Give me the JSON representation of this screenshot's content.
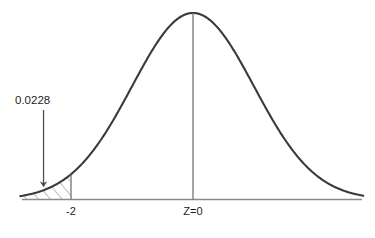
{
  "chart_data": {
    "type": "line",
    "title": "",
    "subtitle": "",
    "xlabel": "",
    "ylabel": "",
    "distribution": "standard normal",
    "mean": 0,
    "sd": 1,
    "xlim": [
      -4.1,
      4.1
    ],
    "ylim": [
      0,
      0.4
    ],
    "grid": false,
    "legend": null,
    "curve": {
      "name": "standard normal density",
      "color": "#3a3a3a",
      "x": [
        -4.1,
        -3.9,
        -3.7,
        -3.5,
        -3.3,
        -3.1,
        -2.9,
        -2.7,
        -2.5,
        -2.3,
        -2.1,
        -2.0,
        -1.9,
        -1.7,
        -1.5,
        -1.3,
        -1.1,
        -0.9,
        -0.7,
        -0.5,
        -0.3,
        -0.1,
        0.0,
        0.1,
        0.3,
        0.5,
        0.7,
        0.9,
        1.1,
        1.3,
        1.5,
        1.7,
        1.9,
        2.0,
        2.1,
        2.3,
        2.5,
        2.7,
        2.9,
        3.1,
        3.3,
        3.5,
        3.7,
        3.9,
        4.1
      ],
      "y": [
        0.0001,
        0.0002,
        0.0004,
        0.0009,
        0.0017,
        0.0033,
        0.006,
        0.0104,
        0.0175,
        0.0283,
        0.044,
        0.054,
        0.0656,
        0.094,
        0.1295,
        0.1714,
        0.2179,
        0.2661,
        0.3123,
        0.3521,
        0.3814,
        0.397,
        0.3989,
        0.397,
        0.3814,
        0.3521,
        0.3123,
        0.2661,
        0.2179,
        0.1714,
        0.1295,
        0.094,
        0.0656,
        0.054,
        0.044,
        0.0283,
        0.0175,
        0.0104,
        0.006,
        0.0033,
        0.0017,
        0.0009,
        0.0004,
        0.0002,
        0.0001
      ]
    },
    "shaded_region": {
      "label": "0.0228",
      "area": 0.0228,
      "from": -4.1,
      "to": -2,
      "fill_style": "diagonal-hatch",
      "hatch_color": "#6a6a6a"
    },
    "vertical_lines": [
      {
        "name": "z-critical-line",
        "x": -2,
        "label": "-2"
      },
      {
        "name": "center-line",
        "x": 0,
        "label": "Z=0"
      }
    ],
    "annotations": [
      {
        "name": "tail-probability",
        "text": "0.0228",
        "arrow": "down",
        "points_to_x": -2.45
      }
    ],
    "axis": {
      "color": "#808080",
      "tick_labels": [
        "-2",
        "Z=0"
      ],
      "tick_x": [
        -2,
        0
      ]
    }
  },
  "labels": {
    "probability": "0.0228",
    "z_critical": "-2",
    "z_center": "Z=0"
  }
}
